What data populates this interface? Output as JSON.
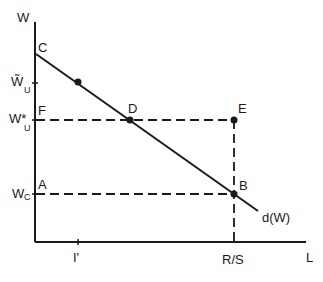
{
  "diagram": {
    "axes": {
      "y_label": "W",
      "x_label": "L"
    },
    "y_ticks": [
      {
        "id": "w-tilde-u",
        "main": "W̃",
        "sub": "U",
        "y": 83
      },
      {
        "id": "w-star-u",
        "main": "W*",
        "sub": "U",
        "y": 120
      },
      {
        "id": "w-c",
        "main": "W",
        "sub": "C",
        "y": 194
      }
    ],
    "x_ticks": [
      {
        "id": "i-prime",
        "label": "I'",
        "x": 78
      },
      {
        "id": "r-over-s",
        "label": "R/S",
        "x": 234
      }
    ],
    "points": {
      "C": {
        "label": "C",
        "x": 36,
        "y": 54
      },
      "D": {
        "label": "D",
        "x": 130,
        "y": 120
      },
      "E": {
        "label": "E",
        "x": 234,
        "y": 120
      },
      "F": {
        "label": "F",
        "x": 36,
        "y": 120
      },
      "A": {
        "label": "A",
        "x": 36,
        "y": 194
      },
      "B": {
        "label": "B",
        "x": 234,
        "y": 194
      }
    },
    "demand_curve_label": "d(W)",
    "colors": {
      "ink": "#1a1a1a",
      "background": "#ffffff"
    }
  }
}
